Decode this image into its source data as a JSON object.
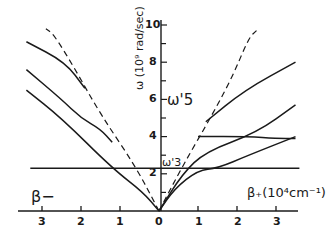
{
  "chart_data": {
    "type": "line",
    "title": "",
    "ylabel": "ω (10^9 rad/sec)",
    "xlabel": "β (10^4 cm^-1)",
    "x_left_label": "β−",
    "x_right_label": "β+ (10⁴cm⁻¹)",
    "x_ticks": [
      "3",
      "2",
      "1",
      "0",
      "1",
      "2",
      "3"
    ],
    "y_ticks": [
      "2",
      "4",
      "6",
      "8",
      "10"
    ],
    "xlim": [
      -3.6,
      3.6
    ],
    "ylim": [
      0,
      10.5
    ],
    "annotations": [
      {
        "text": "ω'5",
        "x": 0.3,
        "y": 6
      },
      {
        "text": "ω'3",
        "x": 0.1,
        "y": 2.3
      }
    ],
    "series": [
      {
        "name": "horizontal ω3 line",
        "style": "solid",
        "points": [
          [
            -3.3,
            2.3
          ],
          [
            3.6,
            2.3
          ]
        ]
      },
      {
        "name": "dashed left light line",
        "style": "dashed",
        "points": [
          [
            0,
            0
          ],
          [
            -0.6,
            2.4
          ],
          [
            -1.5,
            5.2
          ],
          [
            -2.2,
            7.8
          ],
          [
            -2.7,
            9.5
          ],
          [
            -2.9,
            9.8
          ]
        ]
      },
      {
        "name": "dashed right light line",
        "style": "dashed",
        "points": [
          [
            0,
            0
          ],
          [
            0.6,
            2.4
          ],
          [
            1.4,
            5.3
          ],
          [
            1.9,
            7.3
          ],
          [
            2.3,
            9.3
          ],
          [
            2.5,
            9.7
          ]
        ]
      },
      {
        "name": "left branch 1",
        "style": "solid",
        "points": [
          [
            -3.4,
            9.1
          ],
          [
            -2.4,
            8.0
          ],
          [
            -1.9,
            6.6
          ]
        ]
      },
      {
        "name": "left branch 2",
        "style": "solid",
        "points": [
          [
            -3.4,
            7.6
          ],
          [
            -2.5,
            6.0
          ],
          [
            -2.0,
            5.0
          ],
          [
            -1.5,
            4.4
          ],
          [
            -1.2,
            3.7
          ]
        ]
      },
      {
        "name": "left branch 3",
        "style": "solid",
        "points": [
          [
            -3.4,
            6.5
          ],
          [
            -2.5,
            5.0
          ],
          [
            -1.2,
            2.3
          ],
          [
            -0.4,
            1.0
          ],
          [
            0,
            0
          ]
        ]
      },
      {
        "name": "right branch 1",
        "style": "solid",
        "points": [
          [
            1.2,
            4.8
          ],
          [
            2.2,
            6.5
          ],
          [
            3.5,
            8.0
          ]
        ]
      },
      {
        "name": "right branch 2",
        "style": "solid",
        "points": [
          [
            1.0,
            4.0
          ],
          [
            2.3,
            4.0
          ],
          [
            3.0,
            3.9
          ],
          [
            3.5,
            3.9
          ]
        ]
      },
      {
        "name": "right branch 3",
        "style": "solid",
        "points": [
          [
            0.0,
            0
          ],
          [
            0.6,
            2.0
          ],
          [
            1.2,
            3.2
          ],
          [
            2.5,
            4.2
          ],
          [
            3.5,
            5.7
          ]
        ]
      },
      {
        "name": "right branch 4",
        "style": "solid",
        "points": [
          [
            0,
            0
          ],
          [
            0.4,
            1.2
          ],
          [
            1.0,
            2.2
          ],
          [
            1.5,
            2.3
          ],
          [
            2.3,
            3.0
          ],
          [
            3.5,
            4.0
          ]
        ]
      }
    ]
  },
  "labels": {
    "y_axis_label": "ω (10⁹ rad/sec)",
    "omega5": "ω'5",
    "omega3": "ω'3",
    "beta_minus": "β−",
    "beta_plus": "β₊(10⁴cm⁻¹)",
    "x_ticks": [
      "3",
      "2",
      "1",
      "0",
      "1",
      "2",
      "3"
    ],
    "y_ticks": [
      "2",
      "4",
      "6",
      "8",
      "10"
    ]
  }
}
